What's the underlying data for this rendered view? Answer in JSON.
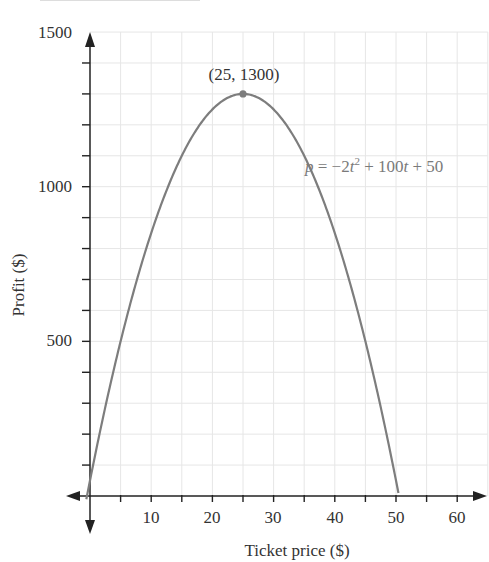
{
  "chart_data": {
    "type": "line",
    "title": "",
    "xlabel": "Ticket price ($)",
    "ylabel": "Profit ($)",
    "xlim": [
      -1,
      65
    ],
    "ylim": [
      -150,
      1500
    ],
    "x_ticks": [
      10,
      20,
      30,
      40,
      50,
      60
    ],
    "y_ticks": [
      500,
      1000,
      1500
    ],
    "x_minor_step": 5,
    "y_minor_step": 100,
    "grid": true,
    "equation": "p = -2t² + 100t + 50",
    "series": [
      {
        "name": "p = -2t^2 + 100t + 50",
        "function": {
          "a": -2,
          "b": 100,
          "c": 50
        },
        "x": [
          -0.5,
          0,
          5,
          10,
          15,
          20,
          25,
          30,
          35,
          40,
          45,
          50,
          50.5
        ],
        "values": [
          -0.5,
          50,
          500,
          850,
          1100,
          1250,
          1300,
          1250,
          1100,
          850,
          500,
          50,
          -0.5
        ],
        "color": "#7d7d7d"
      }
    ],
    "annotations": [
      {
        "label": "(25, 1300)",
        "x": 25,
        "y": 1300,
        "type": "vertex-point"
      }
    ]
  },
  "labels": {
    "vertex": "(25, 1300)",
    "equation_p": "p",
    "equation_eq": " = −2",
    "equation_t1": "t",
    "equation_sup": "2",
    "equation_mid": " + 100",
    "equation_t2": "t",
    "equation_end": " + 50",
    "xlabel": "Ticket price ($)",
    "ylabel": "Profit ($)",
    "xticks": [
      "10",
      "20",
      "30",
      "40",
      "50",
      "60"
    ],
    "yticks": [
      "500",
      "1000",
      "1500"
    ]
  },
  "colors": {
    "curve": "#7d7d7d",
    "grid": "#e6e6e6",
    "axis": "#222222",
    "equation_text": "#7a7a7a"
  }
}
